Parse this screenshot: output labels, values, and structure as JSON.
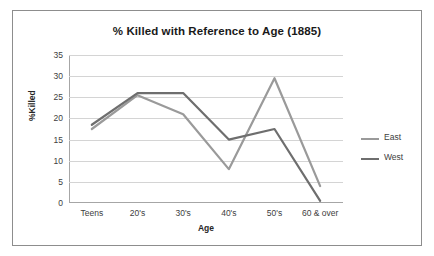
{
  "chart_data": {
    "type": "line",
    "title": "% Killed with Reference to Age (1885)",
    "xlabel": "Age",
    "ylabel": "%Killed",
    "categories": [
      "Teens",
      "20's",
      "30's",
      "40's",
      "50's",
      "60 & over"
    ],
    "ylim": [
      0,
      35
    ],
    "yticks": [
      0,
      5,
      10,
      15,
      20,
      25,
      30,
      35
    ],
    "grid": true,
    "legend_position": "right",
    "series": [
      {
        "name": "East",
        "values": [
          17.5,
          25.5,
          21,
          8,
          29.5,
          4
        ],
        "color": "#9a9a9a"
      },
      {
        "name": "West",
        "values": [
          18.5,
          26,
          26,
          15,
          17.5,
          0.5
        ],
        "color": "#6e6e6e"
      }
    ]
  },
  "legend": {
    "items": [
      {
        "label": "East",
        "color": "#9a9a9a"
      },
      {
        "label": "West",
        "color": "#6e6e6e"
      }
    ]
  }
}
